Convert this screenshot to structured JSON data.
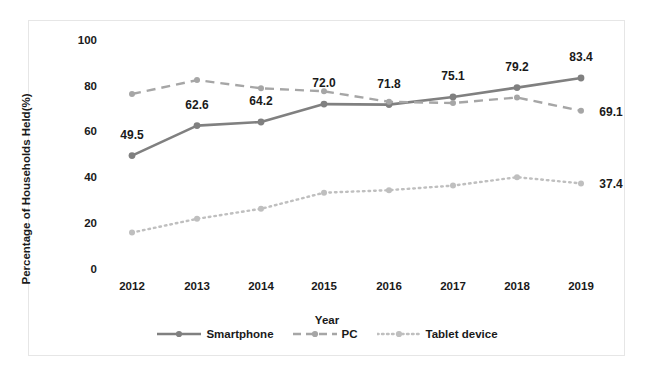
{
  "chart_data": {
    "type": "line",
    "title": "",
    "xlabel": "Year",
    "ylabel": "Percentage of Households Held(%)",
    "categories": [
      "2012",
      "2013",
      "2014",
      "2015",
      "2016",
      "2017",
      "2018",
      "2019"
    ],
    "x": [
      2012,
      2013,
      2014,
      2015,
      2016,
      2017,
      2018,
      2019
    ],
    "ylim": [
      0,
      100
    ],
    "yticks": [
      0,
      20,
      40,
      60,
      80,
      100
    ],
    "grid": false,
    "legend_position": "bottom-center",
    "series": [
      {
        "name": "Smartphone",
        "style": "solid",
        "color": "#808080",
        "values": [
          49.5,
          62.6,
          64.2,
          72.0,
          71.8,
          75.1,
          79.2,
          83.4
        ],
        "labels": [
          "49.5",
          "62.6",
          "64.2",
          "72.0",
          "71.8",
          "75.1",
          "79.2",
          "83.4"
        ]
      },
      {
        "name": "PC",
        "style": "dashed",
        "color": "#a6a6a6",
        "values": [
          76.4,
          82.5,
          78.9,
          77.6,
          73.0,
          72.5,
          74.9,
          69.1
        ],
        "labels": [
          "",
          "",
          "",
          "",
          "",
          "",
          "",
          "69.1"
        ]
      },
      {
        "name": "Tablet device",
        "style": "dotted",
        "color": "#bfbfbf",
        "values": [
          15.9,
          21.9,
          26.3,
          33.3,
          34.4,
          36.4,
          40.1,
          37.4
        ],
        "labels": [
          "",
          "",
          "",
          "",
          "",
          "",
          "",
          "37.4"
        ]
      }
    ]
  },
  "legend": {
    "items": [
      {
        "label": "Smartphone",
        "icon": "solid-line-marker-icon"
      },
      {
        "label": "PC",
        "icon": "dashed-line-marker-icon"
      },
      {
        "label": "Tablet device",
        "icon": "dotted-line-marker-icon"
      }
    ]
  },
  "axis": {
    "ylabel": "Percentage of Households Held(%)",
    "xlabel": "Year",
    "yticks": [
      "100",
      "80",
      "60",
      "40",
      "20",
      "0"
    ],
    "xticks": [
      "2012",
      "2013",
      "2014",
      "2015",
      "2016",
      "2017",
      "2018",
      "2019"
    ]
  },
  "data_labels": {
    "smartphone": [
      "49.5",
      "62.6",
      "64.2",
      "72.0",
      "71.8",
      "75.1",
      "79.2",
      "83.4"
    ],
    "pc_end": "69.1",
    "tablet_end": "37.4"
  }
}
